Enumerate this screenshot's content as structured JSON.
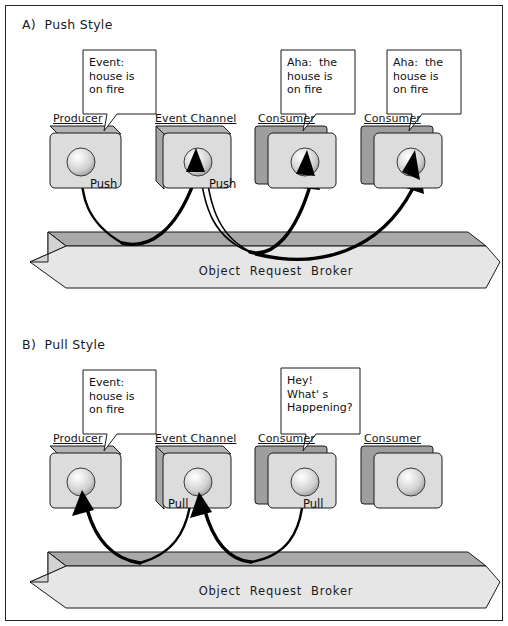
{
  "figure": {
    "width": 508,
    "height": 626,
    "background": "#ffffff",
    "border_color": "#262626"
  },
  "palette": {
    "line": "#1a1a1a",
    "box_front": "#d9d9d9",
    "box_front_light": "#dedede",
    "box_top": "#b4b4b4",
    "box_back": "#9a9a9a",
    "box_side": "#a8a8a8",
    "orb_top": "#a9a9a9",
    "orb_front": "#e2e2e2",
    "orb_cap": "#8f8f8f",
    "sphere_light": "#ffffff",
    "sphere_mid": "#d2d2d2",
    "sphere_dark": "#9e9e9e",
    "bubble_fill": "#ffffff",
    "arrow": "#000000",
    "text": "#111111"
  },
  "sections": [
    {
      "id": "push",
      "title": "A)  Push Style",
      "orb_label": "Object  Request  Broker",
      "nodes": [
        {
          "id": "producer",
          "label": "Producer",
          "verb": "Push",
          "verb_side": "right",
          "has_sphere": true
        },
        {
          "id": "event-channel",
          "label": "Event Channel",
          "verb": "Push",
          "verb_side": "right",
          "has_sphere": true
        },
        {
          "id": "consumer-1",
          "label": "Consumer",
          "verb": "",
          "verb_side": "",
          "has_sphere": true
        },
        {
          "id": "consumer-2",
          "label": "Consumer",
          "verb": "",
          "verb_side": "",
          "has_sphere": true
        }
      ],
      "bubbles": [
        {
          "id": "producer-bubble",
          "lines": [
            "Event:",
            "house is",
            "on fire"
          ]
        },
        {
          "id": "consumer-1-bubble",
          "lines": [
            "Aha:  the",
            "house is",
            "on fire"
          ]
        },
        {
          "id": "consumer-2-bubble",
          "lines": [
            "Aha:  the",
            "house is",
            "on fire"
          ]
        }
      ]
    },
    {
      "id": "pull",
      "title": "B)  Pull Style",
      "orb_label": "Object  Request  Broker",
      "nodes": [
        {
          "id": "producer",
          "label": "Producer",
          "verb": "",
          "verb_side": "",
          "has_sphere": true
        },
        {
          "id": "event-channel",
          "label": "Event Channel",
          "verb": "Pull",
          "verb_side": "left",
          "has_sphere": true
        },
        {
          "id": "consumer-1",
          "label": "Consumer",
          "verb": "Pull",
          "verb_side": "right",
          "has_sphere": true
        },
        {
          "id": "consumer-2",
          "label": "Consumer",
          "verb": "",
          "verb_side": "",
          "has_sphere": true
        }
      ],
      "bubbles": [
        {
          "id": "producer-bubble",
          "lines": [
            "Event:",
            "house is",
            "on fire"
          ]
        },
        {
          "id": "consumer-1-bubble",
          "lines": [
            "Hey!",
            "What' s",
            "Happening?"
          ]
        }
      ]
    }
  ]
}
